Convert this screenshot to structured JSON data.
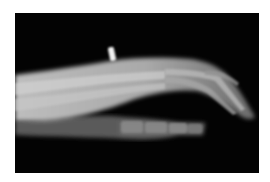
{
  "image": {
    "subject": "lateral hand x-ray radiograph",
    "background_color": "#ffffff",
    "film_color": "#030303",
    "bone_color": "#cfcfcf",
    "soft_tissue_color": "#8a8a8a",
    "marker_color": "#f2f2f2"
  }
}
